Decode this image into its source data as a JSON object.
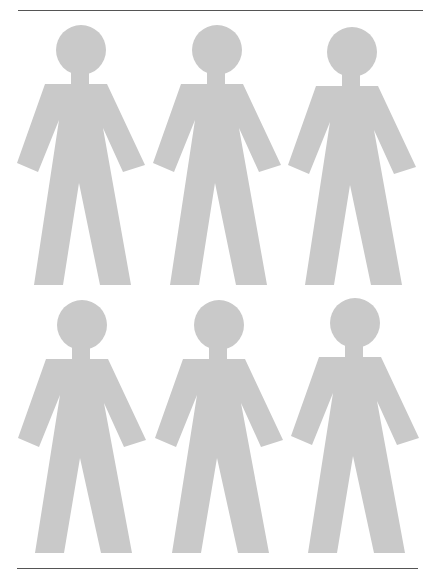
{
  "page": {
    "width": 442,
    "height": 579,
    "background": "#ffffff"
  },
  "colors": {
    "figure_fill": "#c9c9c9",
    "rule": "#555555"
  },
  "rules": [
    {
      "name": "top-rule",
      "x1": 18,
      "x2": 423,
      "y": 10
    },
    {
      "name": "bottom-rule",
      "x1": 17,
      "x2": 418,
      "y": 568
    }
  ],
  "figure_shape": {
    "head_radius": 25,
    "neck": {
      "x1": -10,
      "x2": 8,
      "y1": 18,
      "y2": 37
    },
    "body_points": [
      [
        -36,
        34
      ],
      [
        26,
        34
      ],
      [
        64,
        115
      ],
      [
        42,
        122
      ],
      [
        22,
        78
      ],
      [
        50,
        "L"
      ],
      [
        19,
        "L"
      ],
      [
        -2,
        133
      ],
      [
        -18,
        "L"
      ],
      [
        -47,
        "L"
      ],
      [
        -22,
        70
      ],
      [
        -43,
        122
      ],
      [
        -64,
        113
      ]
    ]
  },
  "figures": [
    {
      "name": "person-figure-1",
      "row": 1,
      "col": 1,
      "cx": 81,
      "cy": 50,
      "leg_bottom": 235,
      "icon": "person-icon"
    },
    {
      "name": "person-figure-2",
      "row": 1,
      "col": 2,
      "cx": 217,
      "cy": 50,
      "leg_bottom": 235,
      "icon": "person-icon"
    },
    {
      "name": "person-figure-3",
      "row": 1,
      "col": 3,
      "cx": 352,
      "cy": 52,
      "leg_bottom": 233,
      "icon": "person-icon"
    },
    {
      "name": "person-figure-4",
      "row": 2,
      "col": 1,
      "cx": 82,
      "cy": 325,
      "leg_bottom": 228,
      "icon": "person-icon"
    },
    {
      "name": "person-figure-5",
      "row": 2,
      "col": 2,
      "cx": 219,
      "cy": 325,
      "leg_bottom": 228,
      "icon": "person-icon"
    },
    {
      "name": "person-figure-6",
      "row": 2,
      "col": 3,
      "cx": 355,
      "cy": 323,
      "leg_bottom": 230,
      "icon": "person-icon"
    }
  ]
}
